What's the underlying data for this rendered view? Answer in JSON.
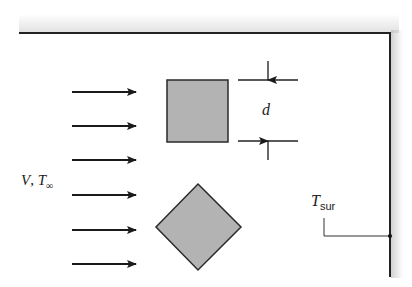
{
  "diagram": {
    "type": "heat-transfer-schematic",
    "labels": {
      "freestream_velocity": "V",
      "freestream_separator": ", ",
      "freestream_temperature": "T",
      "freestream_temperature_subscript": "∞",
      "dimension": "d",
      "surroundings_temperature": "T",
      "surroundings_temperature_subscript": "sur"
    },
    "flow_arrows": {
      "count": 6,
      "y_positions": [
        92,
        126,
        160,
        195,
        230,
        264
      ],
      "x_start": 72,
      "x_end": 136
    },
    "shapes": [
      {
        "name": "square-cross-section",
        "x": 167,
        "y": 80,
        "size": 61,
        "fill": "#b3b3b3"
      },
      {
        "name": "diamond-cross-section",
        "cx": 199,
        "cy": 227,
        "half_diagonal": 43,
        "fill": "#b3b3b3"
      }
    ],
    "colors": {
      "line": "#222222",
      "shape_fill": "#b3b3b3",
      "background": "#ffffff"
    }
  }
}
